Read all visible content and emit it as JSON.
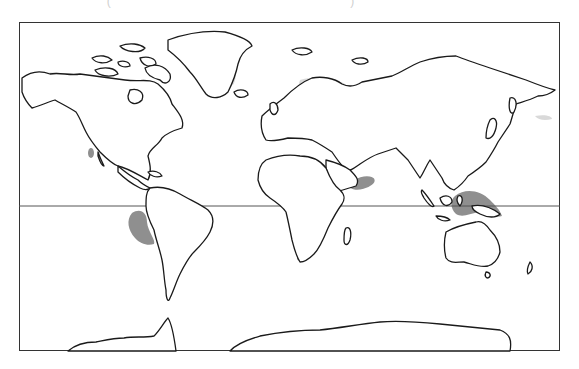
{
  "map": {
    "type": "world-outline-map",
    "projection": "equirectangular-like",
    "title_remnant": "(   )",
    "frame": {
      "left": 19,
      "top": 22,
      "right": 560,
      "bottom": 351
    },
    "equator_y": 206,
    "colors": {
      "outline": "#1a1a1a",
      "light_shading": "#d9d9d9",
      "dark_shading": "#8f8f8f",
      "background": "#ffffff"
    },
    "legend": {
      "light_shading": "High-latitude band (Alaska, northern Canada, Greenland edge, northern Eurasia)",
      "dark_shading": "Localized regions (Baja California, Pacific off Peru, Arabian Sea, East Africa, South Africa tip, Indonesia/New Guinea)"
    },
    "regions_light": [
      "alaska-northern-canada",
      "greenland-east-coast",
      "scandinavia-northern-russia",
      "northern-siberia",
      "kamchatka-north-pacific"
    ],
    "regions_dark": [
      "baja-california",
      "eastern-pacific-off-peru",
      "arabian-sea-oman",
      "east-africa-lakes",
      "southern-africa-tip",
      "indonesia-new-guinea"
    ]
  }
}
